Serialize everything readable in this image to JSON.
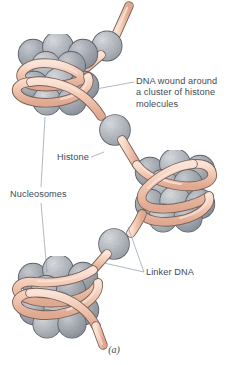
{
  "figure": {
    "caption": "(a)",
    "background_color": "#ffffff",
    "text_color": "#3e4a58"
  },
  "colors": {
    "dna_fill": "#f2c9b4",
    "dna_shadow": "#e0ad96",
    "dna_highlight": "#fae2d6",
    "dna_outline": "#7a6257",
    "histone_fill": "#b9bdc4",
    "histone_shadow": "#9aa0a9",
    "histone_highlight": "#d5d8dd",
    "histone_outline": "#5c6169",
    "leader_line": "#8e99a6"
  },
  "labels": [
    {
      "id": "dna-wound",
      "text": "DNA wound around\na cluster of histone\nmolecules",
      "name": "label-dna-wound-around-histones"
    },
    {
      "id": "histone",
      "text": "Histone",
      "name": "label-histone"
    },
    {
      "id": "nucleosomes",
      "text": "Nucleosomes",
      "name": "label-nucleosomes"
    },
    {
      "id": "linker-dna",
      "text": "Linker DNA",
      "name": "label-linker-dna"
    }
  ],
  "structures": {
    "nucleosome_count": 3,
    "linker_histone_count": 2,
    "nucleosomes": [
      {
        "id": "nucleosome-top",
        "position": "upper-left"
      },
      {
        "id": "nucleosome-middle",
        "position": "middle-right"
      },
      {
        "id": "nucleosome-bottom",
        "position": "lower-left"
      }
    ],
    "linker_histones": [
      {
        "id": "linker-histone-top",
        "position": "top"
      },
      {
        "id": "linker-histone-upper-middle",
        "position": "upper-middle"
      },
      {
        "id": "linker-histone-lower-middle",
        "position": "lower-middle"
      }
    ]
  }
}
